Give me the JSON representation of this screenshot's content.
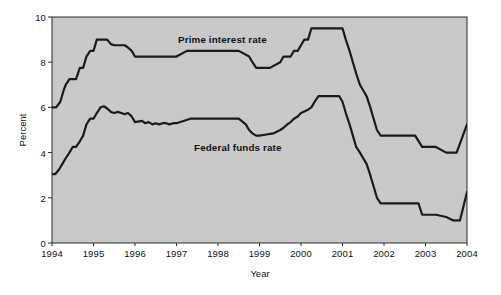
{
  "chart_data": {
    "type": "line",
    "title": "",
    "xlabel": "Year",
    "ylabel": "Percent",
    "xlim": [
      1994,
      2004
    ],
    "ylim": [
      0,
      10
    ],
    "grid": false,
    "legend_position": "inline-annotation",
    "plot_background": "#c9c9c9",
    "line_color": "#1a1a1a",
    "x_ticks": [
      "1994",
      "1995",
      "1996",
      "1997",
      "1998",
      "1999",
      "2000",
      "2001",
      "2002",
      "2003",
      "2004"
    ],
    "y_ticks": [
      "0",
      "2",
      "4",
      "6",
      "8",
      "10"
    ],
    "series": [
      {
        "name": "Prime interest rate",
        "label_text": "Prime interest rate",
        "x": [
          1994.0,
          1994.1,
          1994.2,
          1994.28,
          1994.33,
          1994.42,
          1994.5,
          1994.58,
          1994.67,
          1994.75,
          1994.83,
          1994.92,
          1995.0,
          1995.08,
          1995.17,
          1995.25,
          1995.33,
          1995.42,
          1995.5,
          1995.58,
          1995.67,
          1995.75,
          1995.83,
          1995.92,
          1996.0,
          1996.08,
          1996.17,
          1996.25,
          1996.5,
          1997.0,
          1997.25,
          1997.33,
          1997.5,
          1998.0,
          1998.5,
          1998.75,
          1998.83,
          1998.92,
          1999.0,
          1999.25,
          1999.5,
          1999.58,
          1999.67,
          1999.75,
          1999.83,
          1999.92,
          2000.0,
          2000.08,
          2000.17,
          2000.25,
          2000.33,
          2000.42,
          2000.5,
          2000.75,
          2000.92,
          2001.0,
          2001.08,
          2001.17,
          2001.25,
          2001.33,
          2001.42,
          2001.5,
          2001.58,
          2001.67,
          2001.75,
          2001.83,
          2001.92,
          2002.0,
          2002.25,
          2002.5,
          2002.75,
          2002.92,
          2003.0,
          2003.25,
          2003.5,
          2003.58,
          2003.75,
          2004.0
        ],
        "y": [
          6.0,
          6.0,
          6.25,
          6.75,
          7.0,
          7.25,
          7.25,
          7.25,
          7.75,
          7.75,
          8.25,
          8.5,
          8.5,
          9.0,
          9.0,
          9.0,
          9.0,
          8.8,
          8.75,
          8.75,
          8.75,
          8.75,
          8.65,
          8.5,
          8.25,
          8.25,
          8.25,
          8.25,
          8.25,
          8.25,
          8.5,
          8.5,
          8.5,
          8.5,
          8.5,
          8.25,
          8.0,
          7.75,
          7.75,
          7.75,
          8.0,
          8.25,
          8.25,
          8.25,
          8.5,
          8.5,
          8.75,
          9.0,
          9.0,
          9.5,
          9.5,
          9.5,
          9.5,
          9.5,
          9.5,
          9.5,
          9.0,
          8.5,
          8.0,
          7.5,
          7.0,
          6.75,
          6.5,
          6.0,
          5.5,
          5.0,
          4.75,
          4.75,
          4.75,
          4.75,
          4.75,
          4.25,
          4.25,
          4.25,
          4.0,
          4.0,
          4.0,
          5.25
        ]
      },
      {
        "name": "Federal funds rate",
        "label_text": "Federal funds rate",
        "x": [
          1994.0,
          1994.08,
          1994.17,
          1994.25,
          1994.33,
          1994.42,
          1994.5,
          1994.58,
          1994.67,
          1994.75,
          1994.83,
          1994.92,
          1995.0,
          1995.08,
          1995.17,
          1995.25,
          1995.33,
          1995.42,
          1995.5,
          1995.58,
          1995.67,
          1995.75,
          1995.83,
          1995.92,
          1996.0,
          1996.17,
          1996.25,
          1996.33,
          1996.42,
          1996.5,
          1996.58,
          1996.67,
          1996.75,
          1996.83,
          1996.92,
          1997.0,
          1997.17,
          1997.33,
          1997.5,
          1997.67,
          1997.83,
          1998.0,
          1998.25,
          1998.5,
          1998.67,
          1998.75,
          1998.83,
          1998.92,
          1999.0,
          1999.17,
          1999.33,
          1999.5,
          1999.58,
          1999.67,
          1999.75,
          1999.83,
          1999.92,
          2000.0,
          2000.17,
          2000.25,
          2000.33,
          2000.42,
          2000.5,
          2000.67,
          2000.83,
          2000.92,
          2001.0,
          2001.08,
          2001.17,
          2001.25,
          2001.33,
          2001.42,
          2001.5,
          2001.58,
          2001.67,
          2001.75,
          2001.83,
          2001.92,
          2002.0,
          2002.25,
          2002.5,
          2002.67,
          2002.83,
          2002.92,
          2003.0,
          2003.25,
          2003.5,
          2003.67,
          2003.83,
          2004.0
        ],
        "y": [
          3.05,
          3.05,
          3.25,
          3.5,
          3.75,
          4.0,
          4.25,
          4.25,
          4.5,
          4.75,
          5.25,
          5.5,
          5.5,
          5.75,
          6.0,
          6.05,
          5.95,
          5.8,
          5.75,
          5.8,
          5.75,
          5.7,
          5.75,
          5.6,
          5.35,
          5.4,
          5.3,
          5.35,
          5.25,
          5.3,
          5.25,
          5.3,
          5.3,
          5.25,
          5.3,
          5.3,
          5.4,
          5.5,
          5.5,
          5.5,
          5.5,
          5.5,
          5.5,
          5.5,
          5.25,
          5.0,
          4.85,
          4.75,
          4.75,
          4.8,
          4.85,
          5.0,
          5.1,
          5.25,
          5.35,
          5.5,
          5.6,
          5.75,
          5.9,
          6.0,
          6.25,
          6.5,
          6.5,
          6.5,
          6.5,
          6.5,
          6.25,
          5.75,
          5.25,
          4.75,
          4.25,
          4.0,
          3.75,
          3.5,
          3.0,
          2.5,
          2.0,
          1.75,
          1.75,
          1.75,
          1.75,
          1.75,
          1.75,
          1.25,
          1.25,
          1.25,
          1.15,
          1.0,
          1.0,
          2.25
        ]
      }
    ]
  }
}
